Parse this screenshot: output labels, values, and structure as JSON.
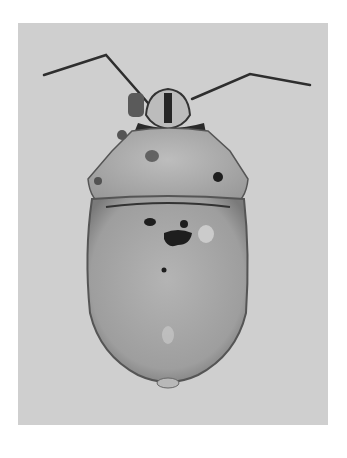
{
  "image": {
    "subject": "shield bug (dorsal view), grayscale specimen photograph",
    "background_color": "#cfcfcf",
    "page_color": "#ffffff",
    "body_color": "#a8a8a8",
    "pronotum_color": "#b2b2b2",
    "marking_color": "#1e1e1e"
  }
}
